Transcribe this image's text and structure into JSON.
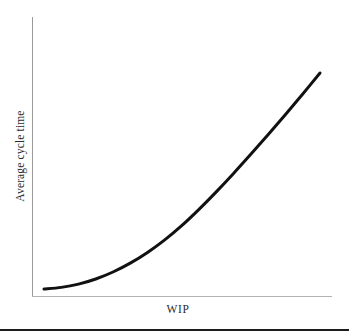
{
  "figure": {
    "background_color": "#ffffff",
    "axis_color": "#9a9a9a",
    "curve_color": "#111111",
    "text_color": "#2b2b2b",
    "rule_color": "#1c1c1c"
  },
  "axes": {
    "y_title": "Average cycle time",
    "x_title": "WIP"
  },
  "chart_data": {
    "type": "line",
    "title": "",
    "subtitle": "",
    "xlabel": "WIP",
    "ylabel": "Average cycle time",
    "xlim": [
      0,
      100
    ],
    "ylim": [
      0,
      100
    ],
    "grid": false,
    "legend": null,
    "tick_labels": {
      "x": [],
      "y": []
    },
    "annotations": [],
    "series": [
      {
        "name": "Average cycle time vs WIP",
        "color": "#111111",
        "line_width": 3,
        "x": [
          4,
          10,
          16,
          22,
          28,
          34,
          40,
          46,
          52,
          58,
          64,
          70,
          76,
          82,
          88,
          94,
          100
        ],
        "y": [
          2.5,
          3.2,
          4.6,
          6.8,
          9.8,
          13.6,
          18.2,
          23.6,
          29.8,
          36.8,
          44.3,
          52.2,
          60.4,
          68.8,
          77.4,
          86.2,
          95.2
        ]
      }
    ]
  }
}
